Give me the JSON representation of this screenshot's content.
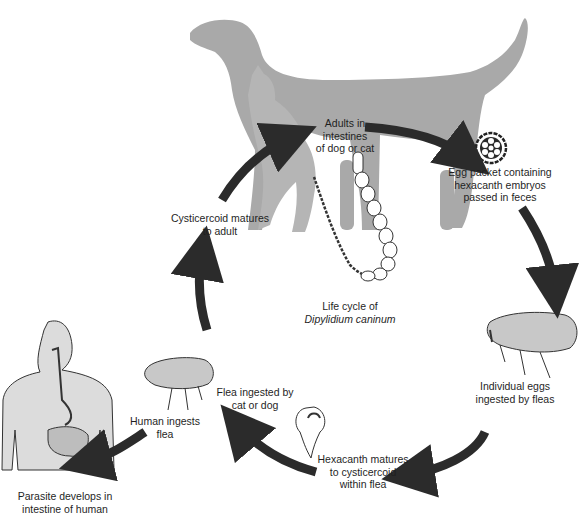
{
  "diagram": {
    "title_line1": "Life cycle of",
    "title_line2": "Dipylidium caninum",
    "colors": {
      "silhouette": "#a9a9a9",
      "arrow": "#2b2b2b",
      "human_body": "#dcdcdc",
      "outline": "#333333"
    },
    "stages": [
      {
        "id": "adults",
        "lines": [
          "Adults in",
          "intestines",
          "of dog or cat"
        ]
      },
      {
        "id": "egg-packet",
        "lines": [
          "Egg packet containing",
          "hexacanth embryos",
          "passed in feces"
        ]
      },
      {
        "id": "eggs-ingested",
        "lines": [
          "Individual eggs",
          "ingested by fleas"
        ]
      },
      {
        "id": "hexacanth",
        "lines": [
          "Hexacanth matures",
          "to cysticercoid",
          "within flea"
        ]
      },
      {
        "id": "flea-ingested",
        "lines": [
          "Flea ingested by",
          "cat or dog"
        ]
      },
      {
        "id": "cysticercoid",
        "lines": [
          "Cysticercoid matures",
          "to adult"
        ]
      },
      {
        "id": "human-ingests",
        "lines": [
          "Human ingests",
          "flea"
        ]
      },
      {
        "id": "human-develops",
        "lines": [
          "Parasite develops in",
          "intestine of human"
        ]
      }
    ],
    "illustrations": [
      "dog-silhouette",
      "cat-silhouette",
      "adult-tapeworm",
      "egg-packet",
      "flea-right",
      "cysticercoid-in-flea",
      "flea-left",
      "human-digestive-system"
    ],
    "arrows": [
      "cysticercoid-to-adults",
      "adults-to-egg-packet",
      "egg-packet-to-flea",
      "eggs-to-hexacanth",
      "hexacanth-to-flea-ingested",
      "flea-to-cysticercoid-up",
      "flea-to-human"
    ]
  }
}
